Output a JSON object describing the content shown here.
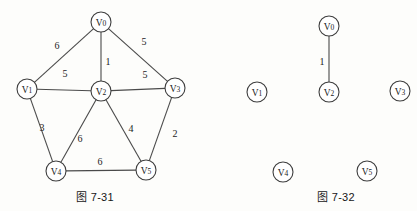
{
  "page": {
    "width": 417,
    "height": 211,
    "background": "#fdfdfb",
    "ink_color": "#3d3d3d"
  },
  "figures": [
    {
      "id": "figure-7-31",
      "caption": "图 7-31",
      "caption_pos": {
        "x": 95,
        "y": 196
      },
      "node_radius": 10,
      "nodes": [
        {
          "id": "V0",
          "label": "V0",
          "x": 101,
          "y": 22
        },
        {
          "id": "V1",
          "label": "V1",
          "x": 27,
          "y": 89
        },
        {
          "id": "V2",
          "label": "V2",
          "x": 101,
          "y": 91
        },
        {
          "id": "V3",
          "label": "V3",
          "x": 175,
          "y": 88
        },
        {
          "id": "V4",
          "label": "V4",
          "x": 56,
          "y": 171
        },
        {
          "id": "V5",
          "label": "V5",
          "x": 146,
          "y": 170
        }
      ],
      "edges": [
        {
          "from": "V0",
          "to": "V1",
          "weight": "6",
          "label_x": 57,
          "label_y": 46
        },
        {
          "from": "V0",
          "to": "V2",
          "weight": "1",
          "label_x": 108,
          "label_y": 62
        },
        {
          "from": "V0",
          "to": "V3",
          "weight": "5",
          "label_x": 144,
          "label_y": 42
        },
        {
          "from": "V1",
          "to": "V2",
          "weight": "5",
          "label_x": 65,
          "label_y": 74
        },
        {
          "from": "V2",
          "to": "V3",
          "weight": "5",
          "label_x": 145,
          "label_y": 75
        },
        {
          "from": "V1",
          "to": "V4",
          "weight": "3",
          "label_x": 42,
          "label_y": 128
        },
        {
          "from": "V2",
          "to": "V4",
          "weight": "6",
          "label_x": 80,
          "label_y": 139
        },
        {
          "from": "V2",
          "to": "V5",
          "weight": "4",
          "label_x": 131,
          "label_y": 129
        },
        {
          "from": "V3",
          "to": "V5",
          "weight": "2",
          "label_x": 175,
          "label_y": 134
        },
        {
          "from": "V4",
          "to": "V5",
          "weight": "6",
          "label_x": 100,
          "label_y": 162
        }
      ]
    },
    {
      "id": "figure-7-32",
      "caption": "图 7-32",
      "caption_pos": {
        "x": 116,
        "y": 196
      },
      "node_radius": 10,
      "nodes": [
        {
          "id": "V0",
          "label": "V0",
          "x": 109,
          "y": 26
        },
        {
          "id": "V1",
          "label": "V1",
          "x": 37,
          "y": 92
        },
        {
          "id": "V2",
          "label": "V2",
          "x": 109,
          "y": 92
        },
        {
          "id": "V3",
          "label": "V3",
          "x": 180,
          "y": 91
        },
        {
          "id": "V4",
          "label": "V4",
          "x": 63,
          "y": 172
        },
        {
          "id": "V5",
          "label": "V5",
          "x": 147,
          "y": 171
        }
      ],
      "edges": [
        {
          "from": "V0",
          "to": "V2",
          "weight": "1",
          "label_x": 102,
          "label_y": 62
        }
      ]
    }
  ]
}
